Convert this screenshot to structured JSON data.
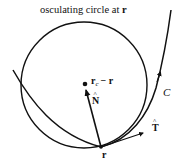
{
  "diagram": {
    "title": "osculating circle at",
    "title_vector": "r",
    "labels": {
      "center": "r",
      "center_sub": "c",
      "center_minus": "− r",
      "normal": "N",
      "tangent": "T",
      "point": "r",
      "curve": "C"
    },
    "elements": [
      {
        "type": "circle",
        "name": "osculating-circle"
      },
      {
        "type": "curve",
        "name": "curve-C",
        "label": "C"
      },
      {
        "type": "vector",
        "name": "unit-normal",
        "label": "N̂"
      },
      {
        "type": "vector",
        "name": "unit-tangent",
        "label": "T̂"
      },
      {
        "type": "point",
        "name": "point-r",
        "label": "r"
      },
      {
        "type": "point",
        "name": "center-point",
        "label": "r_c − r"
      }
    ],
    "colors": {
      "stroke": "#111111",
      "background": "#ffffff"
    }
  }
}
